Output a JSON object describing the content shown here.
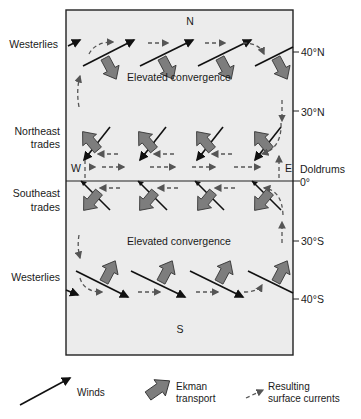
{
  "diagram": {
    "title_markers": {
      "north": "N",
      "south": "S"
    },
    "left_labels": {
      "westerlies_north": "Westerlies",
      "ne_trades_1": "Northeast",
      "ne_trades_2": "trades",
      "se_trades_1": "Southeast",
      "se_trades_2": "trades",
      "westerlies_south": "Westerlies"
    },
    "right_labels": {
      "lat_40n": "40°N",
      "lat_30n": "30°N",
      "doldrums": "Doldrums",
      "lat_0": "0°",
      "lat_30s": "30°S",
      "lat_40s": "40°S"
    },
    "inner_labels": {
      "convergence_north": "Elevated convergence",
      "convergence_south": "Elevated convergence",
      "west": "W",
      "east": "E"
    },
    "legend": {
      "winds": "Winds",
      "ekman_1": "Ekman",
      "ekman_2": "transport",
      "currents_1": "Resulting",
      "currents_2": "surface currents"
    },
    "colors": {
      "background": "#ffffff",
      "panel": "#ececec",
      "frame": "#222222",
      "ekman_fill": "#7d7d7d",
      "current_dash": "#555555"
    }
  }
}
